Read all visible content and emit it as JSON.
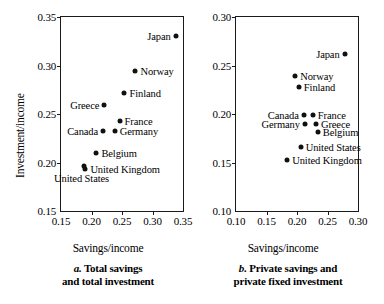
{
  "figure": {
    "ylabel": "Investment/income"
  },
  "chart_data": [
    {
      "type": "scatter",
      "panel": "a",
      "title": "a. Total savings and total investment",
      "caption_letter": "a.",
      "caption_line1": " Total savings",
      "caption_line2": "and total investment",
      "xlabel": "Savings/income",
      "ylabel": "Investment/income",
      "xlim": [
        0.15,
        0.35
      ],
      "ylim": [
        0.15,
        0.35
      ],
      "xticks": [
        "0.15",
        "0.20",
        "0.25",
        "0.30",
        "0.35"
      ],
      "yticks": [
        "0.15",
        "0.20",
        "0.25",
        "0.30",
        "0.35"
      ],
      "xtick_values": [
        0.15,
        0.2,
        0.25,
        0.3,
        0.35
      ],
      "ytick_values": [
        0.15,
        0.2,
        0.25,
        0.3,
        0.35
      ],
      "grid": false,
      "legend": "none",
      "points": [
        {
          "name": "Japan",
          "x": 0.338,
          "y": 0.33,
          "label_side": "left"
        },
        {
          "name": "Norway",
          "x": 0.272,
          "y": 0.294,
          "label_side": "right"
        },
        {
          "name": "Finland",
          "x": 0.254,
          "y": 0.272,
          "label_side": "right"
        },
        {
          "name": "Greece",
          "x": 0.221,
          "y": 0.259,
          "label_side": "left"
        },
        {
          "name": "France",
          "x": 0.246,
          "y": 0.243,
          "label_side": "right"
        },
        {
          "name": "Canada",
          "x": 0.219,
          "y": 0.232,
          "label_side": "left"
        },
        {
          "name": "Germany",
          "x": 0.238,
          "y": 0.232,
          "label_side": "right"
        },
        {
          "name": "Belgium",
          "x": 0.208,
          "y": 0.21,
          "label_side": "right"
        },
        {
          "name": "United Kingdom",
          "x": 0.19,
          "y": 0.193,
          "label_side": "right"
        },
        {
          "name": "United States",
          "x": 0.187,
          "y": 0.196,
          "label_side": "below"
        }
      ]
    },
    {
      "type": "scatter",
      "panel": "b",
      "title": "b. Private savings and private fixed investment",
      "caption_letter": "b.",
      "caption_line1": " Private savings and",
      "caption_line2": "private fixed investment",
      "xlabel": "Savings/income",
      "ylabel": "Investment/income",
      "xlim": [
        0.1,
        0.3
      ],
      "ylim": [
        0.1,
        0.3
      ],
      "xticks": [
        "0.10",
        "0.15",
        "0.20",
        "0.25",
        "0.30"
      ],
      "yticks": [
        "0.10",
        "0.15",
        "0.20",
        "0.25",
        "0.30"
      ],
      "xtick_values": [
        0.1,
        0.15,
        0.2,
        0.25,
        0.3
      ],
      "ytick_values": [
        0.1,
        0.15,
        0.2,
        0.25,
        0.3
      ],
      "grid": false,
      "legend": "none",
      "points": [
        {
          "name": "Japan",
          "x": 0.278,
          "y": 0.262,
          "label_side": "left"
        },
        {
          "name": "Norway",
          "x": 0.197,
          "y": 0.239,
          "label_side": "right"
        },
        {
          "name": "Finland",
          "x": 0.203,
          "y": 0.228,
          "label_side": "right"
        },
        {
          "name": "Canada",
          "x": 0.211,
          "y": 0.199,
          "label_side": "left"
        },
        {
          "name": "France",
          "x": 0.226,
          "y": 0.199,
          "label_side": "right"
        },
        {
          "name": "Germany",
          "x": 0.213,
          "y": 0.19,
          "label_side": "left"
        },
        {
          "name": "Greece",
          "x": 0.231,
          "y": 0.19,
          "label_side": "right"
        },
        {
          "name": "Belgium",
          "x": 0.234,
          "y": 0.181,
          "label_side": "right"
        },
        {
          "name": "United States",
          "x": 0.206,
          "y": 0.166,
          "label_side": "right"
        },
        {
          "name": "United Kingdom",
          "x": 0.184,
          "y": 0.153,
          "label_side": "right"
        }
      ]
    }
  ]
}
